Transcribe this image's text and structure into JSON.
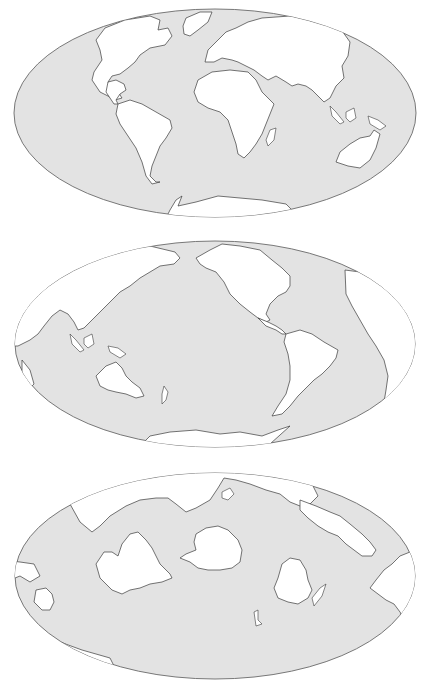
{
  "figure": {
    "panels": [
      {
        "id": "map-1",
        "view": "Atlantic-centered world map",
        "projection": "Mollweide (elliptical)",
        "ellipse": {
          "cx": 215,
          "cy": 113,
          "rx": 201,
          "ry": 104
        },
        "landmasses": [
          "North America",
          "Greenland",
          "South America",
          "Europe",
          "Asia",
          "Africa",
          "Madagascar",
          "Australia",
          "New Guinea",
          "Antarctica"
        ]
      },
      {
        "id": "map-2",
        "view": "Pacific-centered world map",
        "projection": "Mollweide (elliptical)",
        "ellipse": {
          "cx": 215,
          "cy": 114,
          "rx": 200,
          "ry": 103
        },
        "landmasses": [
          "Asia",
          "Australia",
          "New Zealand",
          "North America",
          "South America",
          "Africa",
          "Antarctica"
        ]
      },
      {
        "id": "map-3",
        "view": "Southern-hemisphere oriented world map",
        "projection": "Mollweide (elliptical)",
        "ellipse": {
          "cx": 215,
          "cy": 116,
          "rx": 200,
          "ry": 103
        },
        "landmasses": [
          "Africa",
          "Antarctica",
          "Australia",
          "South America",
          "Asia",
          "New Zealand"
        ]
      }
    ],
    "colors": {
      "ocean": "#e3e3e3",
      "land": "#ffffff",
      "coastline": "#3a3a3a",
      "border": "#6a6a6a",
      "background": "#ffffff"
    }
  }
}
